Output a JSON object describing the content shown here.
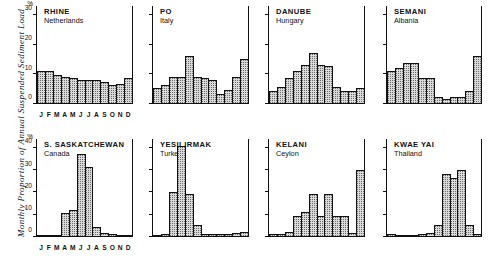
{
  "figure": {
    "ylabel": "Monthly Proportion of Annual Suspended Sediment Load",
    "percent_symbol": "%",
    "months": [
      "J",
      "F",
      "M",
      "A",
      "M",
      "J",
      "J",
      "A",
      "S",
      "O",
      "N",
      "D"
    ]
  },
  "chart_data": [
    {
      "type": "bar",
      "title": "RHINE",
      "subtitle": "Netherlands",
      "categories": [
        "J",
        "F",
        "M",
        "A",
        "M",
        "J",
        "J",
        "A",
        "S",
        "O",
        "N",
        "D"
      ],
      "values": [
        11,
        11,
        9.5,
        9,
        8.5,
        8,
        8,
        8,
        7,
        6,
        6.5,
        8.5
      ],
      "xlabel": "",
      "ylabel": "Monthly Proportion of Annual Suspended Sediment Load",
      "ylim": [
        0,
        33
      ],
      "yticks": [
        0,
        10,
        20,
        30
      ],
      "grid": false,
      "legend": "none"
    },
    {
      "type": "bar",
      "title": "PO",
      "subtitle": "Italy",
      "categories": [
        "J",
        "F",
        "M",
        "A",
        "M",
        "J",
        "J",
        "A",
        "S",
        "O",
        "N",
        "D"
      ],
      "values": [
        5,
        6,
        9,
        9,
        16,
        9,
        8.5,
        8,
        3,
        4.5,
        9,
        15
      ],
      "xlabel": "",
      "ylabel": "",
      "ylim": [
        0,
        33
      ],
      "yticks": [
        0,
        10,
        20,
        30
      ],
      "grid": false,
      "legend": "none"
    },
    {
      "type": "bar",
      "title": "DANUBE",
      "subtitle": "Hungary",
      "categories": [
        "J",
        "F",
        "M",
        "A",
        "M",
        "J",
        "J",
        "A",
        "S",
        "O",
        "N",
        "D"
      ],
      "values": [
        4,
        5.5,
        8.5,
        11,
        13,
        17,
        13,
        12.5,
        5.5,
        4,
        4,
        5
      ],
      "xlabel": "",
      "ylabel": "",
      "ylim": [
        0,
        33
      ],
      "yticks": [
        0,
        10,
        20,
        30
      ],
      "grid": false,
      "legend": "none"
    },
    {
      "type": "bar",
      "title": "SEMANI",
      "subtitle": "Albania",
      "categories": [
        "J",
        "F",
        "M",
        "A",
        "M",
        "J",
        "J",
        "A",
        "S",
        "O",
        "N",
        "D"
      ],
      "values": [
        11,
        12,
        13.5,
        13.5,
        8.5,
        8.5,
        2,
        1.5,
        2,
        2,
        4,
        16
      ],
      "xlabel": "",
      "ylabel": "",
      "ylim": [
        0,
        33
      ],
      "yticks": [
        0,
        10,
        20,
        30
      ],
      "grid": false,
      "legend": "none"
    },
    {
      "type": "bar",
      "title": "S. SASKATCHEWAN",
      "subtitle": "Canada",
      "categories": [
        "J",
        "F",
        "M",
        "A",
        "M",
        "J",
        "J",
        "A",
        "S",
        "O",
        "N",
        "D"
      ],
      "values": [
        0.3,
        0.3,
        0.5,
        10.5,
        12,
        37,
        31.5,
        4,
        1.5,
        0.8,
        0.5,
        0.3
      ],
      "xlabel": "",
      "ylabel": "Monthly Proportion of Annual Suspended Sediment Load",
      "ylim": [
        0,
        44
      ],
      "yticks": [
        0,
        10,
        20,
        30,
        40
      ],
      "grid": false,
      "legend": "none"
    },
    {
      "type": "bar",
      "title": "YESILIRMAK",
      "subtitle": "Turkey",
      "categories": [
        "J",
        "F",
        "M",
        "A",
        "M",
        "J",
        "J",
        "A",
        "S",
        "O",
        "N",
        "D"
      ],
      "values": [
        0.5,
        0.8,
        20,
        41,
        19,
        5,
        1,
        0.8,
        0.8,
        1,
        1.5,
        2
      ],
      "xlabel": "",
      "ylabel": "",
      "ylim": [
        0,
        44
      ],
      "yticks": [
        0,
        10,
        20,
        30,
        40
      ],
      "grid": false,
      "legend": "none"
    },
    {
      "type": "bar",
      "title": "KELANI",
      "subtitle": "Ceylon",
      "categories": [
        "J",
        "F",
        "M",
        "A",
        "M",
        "J",
        "J",
        "A",
        "S",
        "O",
        "N",
        "D"
      ],
      "values": [
        1,
        1,
        2,
        9,
        11,
        19,
        9,
        19,
        9,
        9,
        1.5,
        30
      ],
      "xlabel": "",
      "ylabel": "",
      "ylim": [
        0,
        44
      ],
      "yticks": [
        0,
        10,
        20,
        30,
        40
      ],
      "grid": false,
      "legend": "none"
    },
    {
      "type": "bar",
      "title": "KWAE YAI",
      "subtitle": "Thailand",
      "categories": [
        "J",
        "F",
        "M",
        "A",
        "M",
        "J",
        "J",
        "A",
        "S",
        "O",
        "N",
        "D"
      ],
      "values": [
        0.8,
        0.5,
        0.5,
        0.5,
        0.8,
        1.5,
        5,
        28,
        26.5,
        30,
        5,
        0.8
      ],
      "xlabel": "",
      "ylabel": "",
      "ylim": [
        0,
        44
      ],
      "yticks": [
        0,
        10,
        20,
        30,
        40
      ],
      "grid": false,
      "legend": "none"
    }
  ]
}
